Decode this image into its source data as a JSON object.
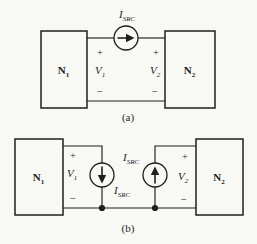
{
  "figure": {
    "background": "#f8f8f5",
    "ink": "#1f1f1f",
    "captions": {
      "a": "(a)",
      "b": "(b)"
    },
    "diagram_a": {
      "network_left": {
        "base": "N",
        "sub": "1"
      },
      "network_right": {
        "base": "N",
        "sub": "2"
      },
      "voltage_left": {
        "plus": "+",
        "base": "V",
        "sub": "1",
        "minus": "−"
      },
      "voltage_right": {
        "plus": "+",
        "base": "V",
        "sub": "2",
        "minus": "−"
      },
      "current_source": {
        "base": "I",
        "sub": "SRC",
        "direction": "right"
      }
    },
    "diagram_b": {
      "network_left": {
        "base": "N",
        "sub": "1"
      },
      "network_right": {
        "base": "N",
        "sub": "2"
      },
      "voltage_left": {
        "plus": "+",
        "base": "V",
        "sub": "1",
        "minus": "−"
      },
      "voltage_right": {
        "plus": "+",
        "base": "V",
        "sub": "2",
        "minus": "−"
      },
      "current_source_left": {
        "base": "I",
        "sub": "SRC",
        "direction": "down"
      },
      "current_source_right": {
        "base": "I",
        "sub": "SRC",
        "direction": "up"
      }
    }
  }
}
